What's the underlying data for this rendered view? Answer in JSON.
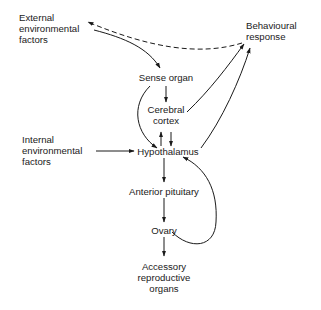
{
  "diagram": {
    "nodes": {
      "external": [
        "External",
        "environmental",
        "factors"
      ],
      "behaviour": [
        "Behavioural",
        "response"
      ],
      "sense_organ": "Sense organ",
      "cortex": [
        "Cerebral",
        "cortex"
      ],
      "internal": [
        "Internal",
        "environmental",
        "factors"
      ],
      "hypothalamus": "Hypothalamus",
      "anterior_pituitary": "Anterior pituitary",
      "ovary": "Ovary",
      "accessory": [
        "Accessory",
        "reproductive",
        "organs"
      ]
    },
    "edges": [
      {
        "from": "External environmental factors",
        "to": "Sense organ",
        "style": "solid"
      },
      {
        "from": "Behavioural response",
        "to": "External environmental factors",
        "style": "dashed"
      },
      {
        "from": "Sense organ",
        "to": "Cerebral cortex",
        "style": "solid"
      },
      {
        "from": "Sense organ",
        "to": "Hypothalamus",
        "style": "solid"
      },
      {
        "from": "Cerebral cortex",
        "to": "Hypothalamus",
        "style": "solid"
      },
      {
        "from": "Hypothalamus",
        "to": "Cerebral cortex",
        "style": "solid"
      },
      {
        "from": "Cerebral cortex",
        "to": "Behavioural response",
        "style": "solid"
      },
      {
        "from": "Hypothalamus",
        "to": "Behavioural response",
        "style": "solid"
      },
      {
        "from": "Internal environmental factors",
        "to": "Hypothalamus",
        "style": "solid"
      },
      {
        "from": "Hypothalamus",
        "to": "Anterior pituitary",
        "style": "solid"
      },
      {
        "from": "Anterior pituitary",
        "to": "Ovary",
        "style": "solid"
      },
      {
        "from": "Ovary",
        "to": "Hypothalamus",
        "style": "solid"
      },
      {
        "from": "Ovary",
        "to": "Accessory reproductive organs",
        "style": "solid"
      }
    ],
    "line_color": "#1a1a1a"
  }
}
